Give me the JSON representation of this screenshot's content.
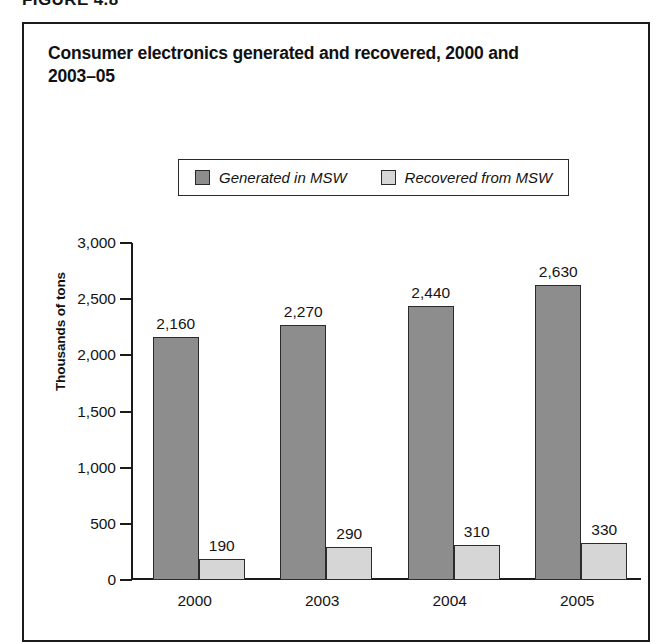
{
  "figure": {
    "number_label": "FIGURE 4.8"
  },
  "chart_data": {
    "type": "bar",
    "title": "Consumer electronics generated and recovered, 2000 and 2003–05",
    "xlabel": "",
    "ylabel": "Thousands of tons",
    "ylim": [
      0,
      3000
    ],
    "ytick_labels": [
      "3,000",
      "2,500",
      "2,000",
      "1,500",
      "1,000",
      "500",
      "0"
    ],
    "ytick_values": [
      3000,
      2500,
      2000,
      1500,
      1000,
      500,
      0
    ],
    "grid": false,
    "legend_position": "top-center",
    "categories": [
      "2000",
      "2003",
      "2004",
      "2005"
    ],
    "series": [
      {
        "name": "Generated in MSW",
        "color": "#8d8d8d",
        "values": [
          2160,
          2270,
          2440,
          2630
        ],
        "value_labels": [
          "2,160",
          "2,270",
          "2,440",
          "2,630"
        ]
      },
      {
        "name": "Recovered from MSW",
        "color": "#d6d6d6",
        "values": [
          190,
          290,
          310,
          330
        ],
        "value_labels": [
          "190",
          "290",
          "310",
          "330"
        ]
      }
    ]
  }
}
